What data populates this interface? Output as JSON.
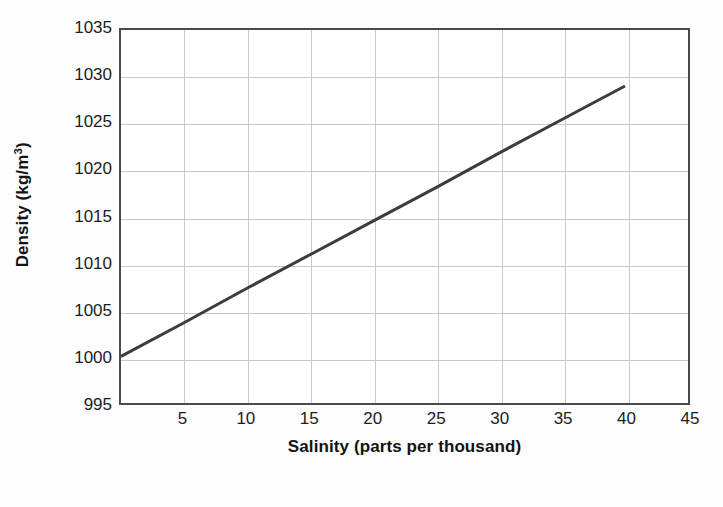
{
  "chart_data": {
    "type": "line",
    "title": "",
    "xlabel": "Salinity (parts per thousand)",
    "ylabel": "Density (kg/m³)",
    "ylabel_base": "Density (kg/m",
    "ylabel_sup": "3",
    "ylabel_tail": ")",
    "xlim": [
      0,
      45
    ],
    "ylim": [
      995,
      1035
    ],
    "xticks": [
      5,
      10,
      15,
      20,
      25,
      30,
      35,
      40,
      45
    ],
    "yticks": [
      1035,
      1030,
      1025,
      1020,
      1015,
      1010,
      1005,
      1000,
      995
    ],
    "xtick_labels": [
      "5",
      "10",
      "15",
      "20",
      "25",
      "30",
      "35",
      "40",
      "45"
    ],
    "ytick_labels": [
      "1035",
      "1030",
      "1025",
      "1020",
      "1015",
      "1010",
      "1005",
      "1000",
      "995"
    ],
    "grid": true,
    "legend": "none",
    "line_color": "#3c3c3c",
    "line_width": 3,
    "frame_color": "#4a4a4a",
    "grid_color": "#c9c9c9",
    "background": "#ffffff",
    "series": [
      {
        "name": "Seawater density vs salinity",
        "x": [
          0,
          5,
          10,
          15,
          20,
          25,
          30,
          35,
          40
        ],
        "values": [
          1000.0,
          1003.6,
          1007.3,
          1010.9,
          1014.5,
          1018.1,
          1021.8,
          1025.4,
          1029.0
        ]
      }
    ],
    "annotations": []
  }
}
